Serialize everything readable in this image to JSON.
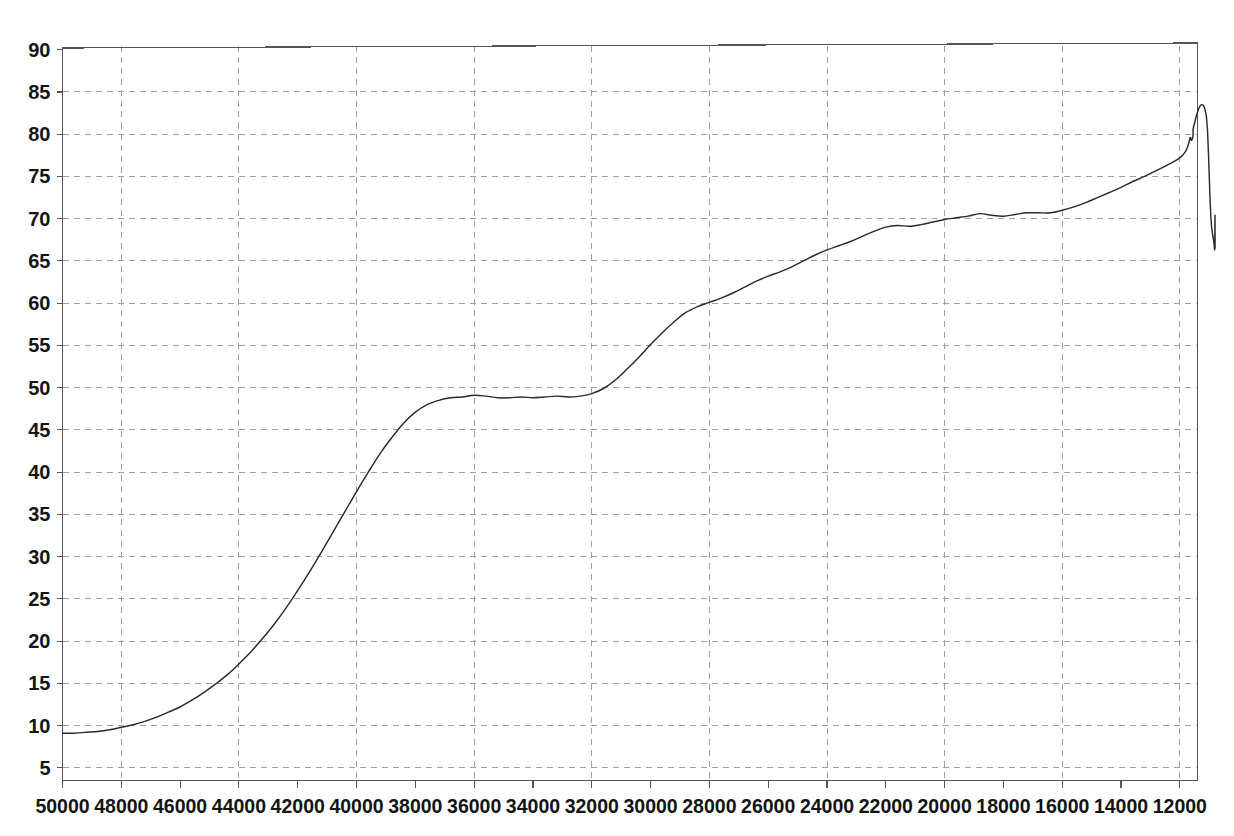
{
  "chart_data": {
    "type": "line",
    "title": "",
    "subtitle": "",
    "xlabel": "",
    "ylabel": "",
    "xlim": [
      50000,
      11400
    ],
    "ylim": [
      3.5,
      90.5
    ],
    "x_axis_reversed": true,
    "grid": true,
    "grid_style": "dashed",
    "legend": "none",
    "x_tick_labels": [
      "50000",
      "48000",
      "46000",
      "44000",
      "42000",
      "40000",
      "38000",
      "36000",
      "34000",
      "32000",
      "30000",
      "28000",
      "26000",
      "24000",
      "22000",
      "20000",
      "18000",
      "16000",
      "14000",
      "12000"
    ],
    "x_ticks": [
      50000,
      48000,
      46000,
      44000,
      42000,
      40000,
      38000,
      36000,
      34000,
      32000,
      30000,
      28000,
      26000,
      24000,
      22000,
      20000,
      18000,
      16000,
      14000,
      12000
    ],
    "x_gridlines": [
      48000,
      44000,
      40000,
      36000,
      32000,
      28000,
      24000,
      20000,
      16000,
      12000
    ],
    "y_tick_labels": [
      "90",
      "85",
      "80",
      "75",
      "70",
      "65",
      "60",
      "55",
      "50",
      "45",
      "40",
      "35",
      "30",
      "25",
      "20",
      "15",
      "10",
      "5"
    ],
    "y_ticks": [
      90,
      85,
      80,
      75,
      70,
      65,
      60,
      55,
      50,
      45,
      40,
      35,
      30,
      25,
      20,
      15,
      10,
      5
    ],
    "y_gridlines": [
      85,
      80,
      75,
      70,
      65,
      60,
      55,
      50,
      45,
      40,
      35,
      30,
      25,
      20,
      15,
      10,
      5
    ],
    "line_color": "#2b2b2b",
    "grid_color": "#9a9a9a",
    "axis_color": "#555555",
    "series": [
      {
        "name": "series-1",
        "x": [
          50000,
          49600,
          49200,
          48800,
          48400,
          48000,
          47600,
          47200,
          46800,
          46400,
          46000,
          45600,
          45200,
          44800,
          44400,
          44000,
          43600,
          43200,
          42800,
          42400,
          42000,
          41600,
          41200,
          40800,
          40400,
          40000,
          39600,
          39200,
          38800,
          38400,
          38000,
          37600,
          37200,
          36800,
          36400,
          36000,
          35600,
          35200,
          34800,
          34400,
          34000,
          33600,
          33200,
          32800,
          32400,
          32000,
          31600,
          31200,
          30800,
          30400,
          30000,
          29600,
          29200,
          28800,
          28400,
          28000,
          27600,
          27200,
          26800,
          26400,
          26000,
          25600,
          25200,
          24800,
          24400,
          24000,
          23600,
          23200,
          22800,
          22400,
          22000,
          21600,
          21200,
          20800,
          20400,
          20000,
          19600,
          19200,
          18800,
          18400,
          18000,
          17600,
          17200,
          16800,
          16400,
          16000,
          15600,
          15200,
          14800,
          14400,
          14000,
          13600,
          13200,
          12800,
          12400,
          12000,
          11800,
          11700,
          11650,
          11600,
          11550
        ],
        "y": [
          9.1,
          9.1,
          9.2,
          9.3,
          9.5,
          9.8,
          10.1,
          10.5,
          11.0,
          11.6,
          12.2,
          13.0,
          13.9,
          14.9,
          16.0,
          17.3,
          18.7,
          20.3,
          22.0,
          23.9,
          26.0,
          28.2,
          30.5,
          32.9,
          35.3,
          37.7,
          40.0,
          42.2,
          44.1,
          45.8,
          47.1,
          48.0,
          48.5,
          48.8,
          48.9,
          49.1,
          49.0,
          48.8,
          48.8,
          48.9,
          48.8,
          48.9,
          49.0,
          48.9,
          49.0,
          49.3,
          49.9,
          50.9,
          52.2,
          53.6,
          55.1,
          56.5,
          57.8,
          58.9,
          59.6,
          60.1,
          60.6,
          61.2,
          61.9,
          62.6,
          63.2,
          63.7,
          64.3,
          65.0,
          65.7,
          66.3,
          66.8,
          67.3,
          67.9,
          68.5,
          69.0,
          69.2,
          69.1,
          69.3,
          69.6,
          69.9,
          70.1,
          70.3,
          70.6,
          70.4,
          70.3,
          70.5,
          70.7,
          70.7,
          70.7,
          71.0,
          71.4,
          71.9,
          72.5,
          73.1,
          73.7,
          74.4,
          75.0,
          75.7,
          76.4,
          77.2,
          78.0,
          78.9,
          79.6,
          79.3,
          79.9
        ]
      }
    ],
    "series_detail_tail": {
      "x": [
        11550,
        11500,
        11450,
        11400,
        11350,
        11300,
        11250,
        11200,
        11150,
        11100
      ],
      "y": [
        80.6,
        81.3,
        82.0,
        82.6,
        83.1,
        83.4,
        83.5,
        83.4,
        83.0,
        82.2
      ]
    },
    "key_points": [
      {
        "x": 50000,
        "y": 9.1,
        "label": "start"
      },
      {
        "x": 42000,
        "y": 26.0,
        "label": "rise"
      },
      {
        "x": 38000,
        "y": 47.1,
        "label": "knee"
      },
      {
        "x": 37500,
        "y": 49.0,
        "label": "plateau-start"
      },
      {
        "x": 35800,
        "y": 48.8,
        "label": "plateau-end"
      },
      {
        "x": 30000,
        "y": 55.1,
        "label": "mid-climb"
      },
      {
        "x": 26000,
        "y": 63.2,
        "label": "mid"
      },
      {
        "x": 22000,
        "y": 69.0,
        "label": "shoulder"
      },
      {
        "x": 18800,
        "y": 70.6,
        "label": "plateau-2"
      },
      {
        "x": 15250,
        "y": 83.5,
        "label": "peak"
      },
      {
        "x": 13000,
        "y": 72.0,
        "label": "decline"
      },
      {
        "x": 11750,
        "y": 66.5,
        "label": "min-right"
      },
      {
        "x": 11600,
        "y": 70.2,
        "label": "edge-spike"
      }
    ]
  }
}
